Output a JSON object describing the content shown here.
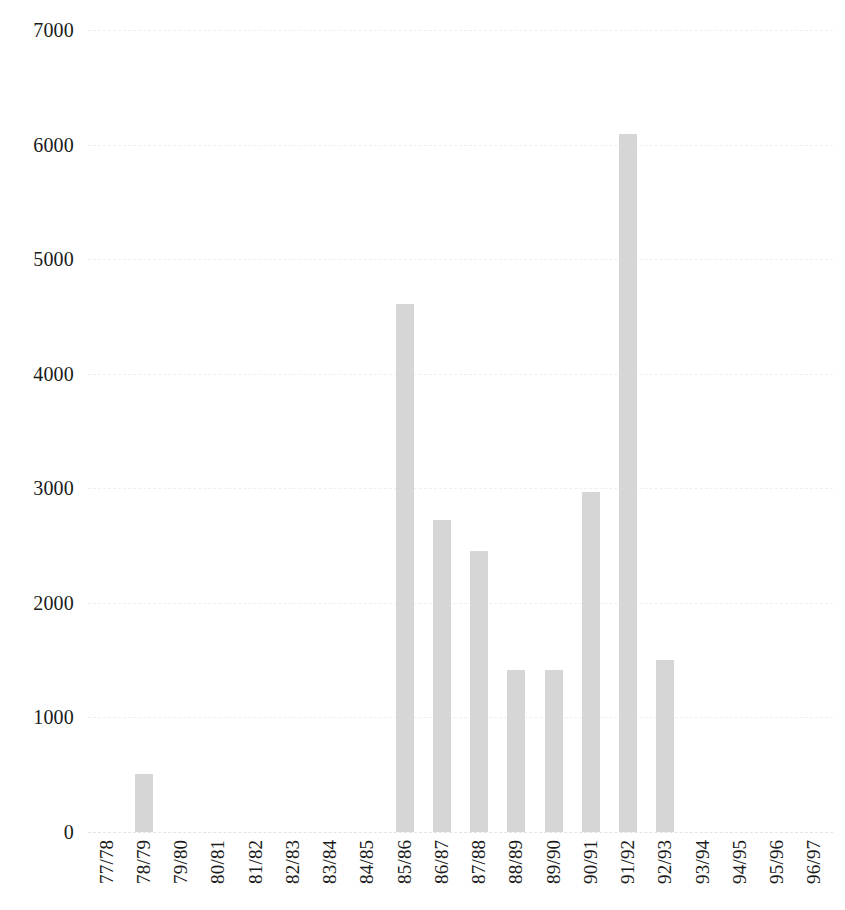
{
  "chart_data": {
    "type": "bar",
    "title": "",
    "subtitle": "",
    "xlabel": "",
    "ylabel": "",
    "categories": [
      "77/78",
      "78/79",
      "79/80",
      "80/81",
      "81/82",
      "82/83",
      "83/84",
      "84/85",
      "85/86",
      "86/87",
      "87/88",
      "88/89",
      "89/90",
      "90/91",
      "91/92",
      "92/93",
      "93/94",
      "94/95",
      "95/96",
      "96/97"
    ],
    "values": [
      0,
      510,
      0,
      0,
      0,
      0,
      0,
      0,
      4610,
      2720,
      2450,
      1410,
      1410,
      2970,
      6090,
      1500,
      0,
      0,
      0,
      0
    ],
    "ylim": [
      0,
      7000
    ],
    "yticks": [
      0,
      1000,
      2000,
      3000,
      4000,
      5000,
      6000,
      7000
    ],
    "ytick_labels": [
      "0",
      "1000",
      "2000",
      "3000",
      "4000",
      "5000",
      "6000",
      "7000"
    ],
    "grid": true,
    "grid_axis": "y",
    "legend": false,
    "legend_position": "none",
    "bar_color": "#d6d6d6",
    "text_color": "#1a1a1a",
    "background_color": "#ffffff"
  }
}
